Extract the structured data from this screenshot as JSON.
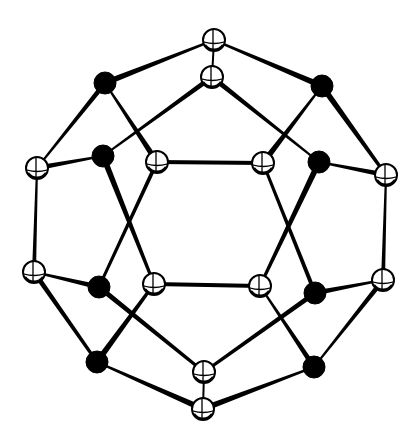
{
  "figure": {
    "type": "ball-and-stick cage structure",
    "background": "#ffffff",
    "ink": "#000000",
    "atom_radius_open": 11,
    "atom_radius_filled": 11,
    "atoms": [
      {
        "id": "A1",
        "kind": "open",
        "x": 214,
        "y": 40
      },
      {
        "id": "A2",
        "kind": "open",
        "x": 212,
        "y": 77
      },
      {
        "id": "B1",
        "kind": "filled",
        "x": 105,
        "y": 83
      },
      {
        "id": "B2",
        "kind": "filled",
        "x": 322,
        "y": 86
      },
      {
        "id": "C1",
        "kind": "open",
        "x": 37,
        "y": 168
      },
      {
        "id": "B3",
        "kind": "filled",
        "x": 103,
        "y": 156
      },
      {
        "id": "A3",
        "kind": "open",
        "x": 157,
        "y": 162
      },
      {
        "id": "A4",
        "kind": "open",
        "x": 263,
        "y": 163
      },
      {
        "id": "B4",
        "kind": "filled",
        "x": 319,
        "y": 162
      },
      {
        "id": "C2",
        "kind": "open",
        "x": 386,
        "y": 175
      },
      {
        "id": "C3",
        "kind": "open",
        "x": 34,
        "y": 272
      },
      {
        "id": "B5",
        "kind": "filled",
        "x": 99,
        "y": 287
      },
      {
        "id": "A5",
        "kind": "open",
        "x": 154,
        "y": 284
      },
      {
        "id": "A6",
        "kind": "open",
        "x": 260,
        "y": 286
      },
      {
        "id": "B6",
        "kind": "filled",
        "x": 315,
        "y": 293
      },
      {
        "id": "C4",
        "kind": "open",
        "x": 383,
        "y": 280
      },
      {
        "id": "B7",
        "kind": "filled",
        "x": 97,
        "y": 362
      },
      {
        "id": "A7",
        "kind": "open",
        "x": 204,
        "y": 372
      },
      {
        "id": "B8",
        "kind": "filled",
        "x": 314,
        "y": 367
      },
      {
        "id": "A8",
        "kind": "open",
        "x": 203,
        "y": 409
      }
    ],
    "bonds": [
      {
        "a": "A1",
        "b": "A2",
        "w1": 2,
        "w2": 2
      },
      {
        "a": "A1",
        "b": "B1",
        "w1": 2,
        "w2": 6
      },
      {
        "a": "A1",
        "b": "B2",
        "w1": 2,
        "w2": 6
      },
      {
        "a": "B1",
        "b": "C1",
        "w1": 5,
        "w2": 2
      },
      {
        "a": "B1",
        "b": "A3",
        "w1": 2,
        "w2": 6
      },
      {
        "a": "A2",
        "b": "B3",
        "w1": 5,
        "w2": 2
      },
      {
        "a": "A2",
        "b": "B4",
        "w1": 5,
        "w2": 2
      },
      {
        "a": "B2",
        "b": "A4",
        "w1": 2,
        "w2": 6
      },
      {
        "a": "B2",
        "b": "C2",
        "w1": 6,
        "w2": 3
      },
      {
        "a": "C1",
        "b": "B3",
        "w1": 5,
        "w2": 2
      },
      {
        "a": "B3",
        "b": "A5",
        "w1": 6,
        "w2": 3
      },
      {
        "a": "A3",
        "b": "B5",
        "w1": 4,
        "w2": 3
      },
      {
        "a": "A3",
        "b": "A4",
        "w1": 4,
        "w2": 4
      },
      {
        "a": "A4",
        "b": "B6",
        "w1": 3,
        "w2": 4
      },
      {
        "a": "B4",
        "b": "A6",
        "w1": 6,
        "w2": 3
      },
      {
        "a": "C2",
        "b": "B4",
        "w1": 5,
        "w2": 2
      },
      {
        "a": "C1",
        "b": "C3",
        "w1": 2,
        "w2": 4
      },
      {
        "a": "C2",
        "b": "C4",
        "w1": 2,
        "w2": 4
      },
      {
        "a": "C3",
        "b": "B5",
        "w1": 2,
        "w2": 5
      },
      {
        "a": "C3",
        "b": "B7",
        "w1": 5,
        "w2": 3
      },
      {
        "a": "A5",
        "b": "A6",
        "w1": 4,
        "w2": 4
      },
      {
        "a": "B5",
        "b": "A7",
        "w1": 5,
        "w2": 3
      },
      {
        "a": "A5",
        "b": "B7",
        "w1": 3,
        "w2": 6
      },
      {
        "a": "A6",
        "b": "B8",
        "w1": 2,
        "w2": 5
      },
      {
        "a": "B6",
        "b": "A7",
        "w1": 5,
        "w2": 3
      },
      {
        "a": "B6",
        "b": "C4",
        "w1": 5,
        "w2": 2
      },
      {
        "a": "C4",
        "b": "B8",
        "w1": 5,
        "w2": 2
      },
      {
        "a": "B7",
        "b": "A8",
        "w1": 2,
        "w2": 6
      },
      {
        "a": "B8",
        "b": "A8",
        "w1": 2,
        "w2": 6
      },
      {
        "a": "A7",
        "b": "A8",
        "w1": 2,
        "w2": 2
      }
    ]
  }
}
